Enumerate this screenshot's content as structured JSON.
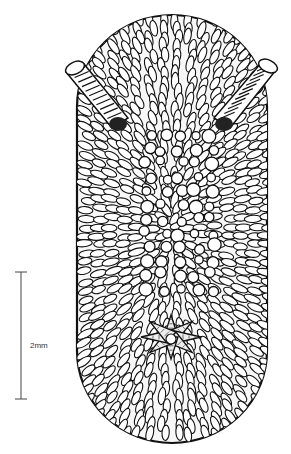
{
  "figure": {
    "scale_bar": {
      "label": "2mm",
      "length_mm": 2
    },
    "parts": [
      "rhinophore-left",
      "rhinophore-right",
      "dorsal-tubercles",
      "branchial-plume"
    ],
    "colors": {
      "ink": "#111111",
      "paper": "#ffffff",
      "scale": "#444444"
    }
  }
}
